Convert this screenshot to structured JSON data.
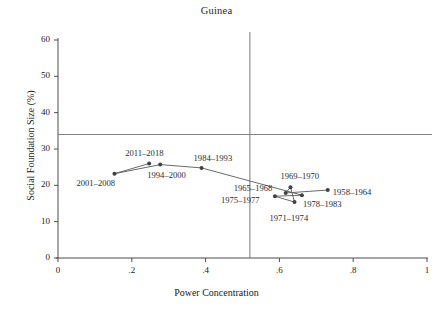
{
  "chart_data": {
    "type": "scatter",
    "title": "Guinea",
    "xlabel": "Power Concentration",
    "ylabel": "Social Foundation Size (%)",
    "xlim": [
      0,
      1
    ],
    "ylim": [
      0,
      62
    ],
    "xticks": [
      "0",
      ".2",
      ".4",
      ".6",
      ".8",
      "1"
    ],
    "xtick_values": [
      0,
      0.2,
      0.4,
      0.6,
      0.8,
      1
    ],
    "yticks": [
      "0",
      "10",
      "20",
      "30",
      "40",
      "50",
      "60"
    ],
    "ytick_values": [
      0,
      10,
      20,
      30,
      40,
      50,
      60
    ],
    "grid": false,
    "legend": "none",
    "connected": true,
    "reference_lines": [
      {
        "orientation": "horizontal",
        "value": 34,
        "color": "#808080"
      },
      {
        "orientation": "vertical",
        "value": 0.52,
        "color": "#808080"
      }
    ],
    "marker_color": "#404040",
    "line_color": "#595959",
    "points": [
      {
        "label": "2001–2008",
        "x": 0.153,
        "y": 23.2,
        "label_dx": -38,
        "label_dy": 10
      },
      {
        "label": "2011–2018",
        "x": 0.247,
        "y": 26.0,
        "label_dx": -24,
        "label_dy": -10
      },
      {
        "label": "1994–2000",
        "x": 0.277,
        "y": 25.7,
        "label_dx": -13,
        "label_dy": 11
      },
      {
        "label": "1984–1993",
        "x": 0.389,
        "y": 24.8,
        "label_dx": -8,
        "label_dy": -9
      },
      {
        "label": "1965–1968",
        "x": 0.617,
        "y": 17.9,
        "label_dx": -52,
        "label_dy": -4
      },
      {
        "label": "1969–1970",
        "x": 0.63,
        "y": 19.5,
        "label_dx": -10,
        "label_dy": -10
      },
      {
        "label": "1975–1977",
        "x": 0.588,
        "y": 17.0,
        "label_dx": -54,
        "label_dy": 5
      },
      {
        "label": "1971–1974",
        "x": 0.641,
        "y": 15.4,
        "label_dx": -25,
        "label_dy": 17
      },
      {
        "label": "1978–1983",
        "x": 0.661,
        "y": 17.3,
        "label_dx": 1,
        "label_dy": 10
      },
      {
        "label": "1958–1964",
        "x": 0.731,
        "y": 18.7,
        "label_dx": 5,
        "label_dy": 3
      }
    ],
    "path_order": [
      "1958–1964",
      "1965–1968",
      "1969–1970",
      "1971–1974",
      "1975–1977",
      "1978–1983",
      "1984–1993",
      "1994–2000",
      "2001–2008",
      "2011–2018"
    ],
    "series_path_x": [
      0.153,
      0.247,
      0.277,
      0.389,
      0.617,
      0.63,
      0.661,
      0.731
    ],
    "series_path_y": [
      23.2,
      26.0,
      25.7,
      24.8,
      17.9,
      19.5,
      17.3,
      18.7
    ]
  }
}
